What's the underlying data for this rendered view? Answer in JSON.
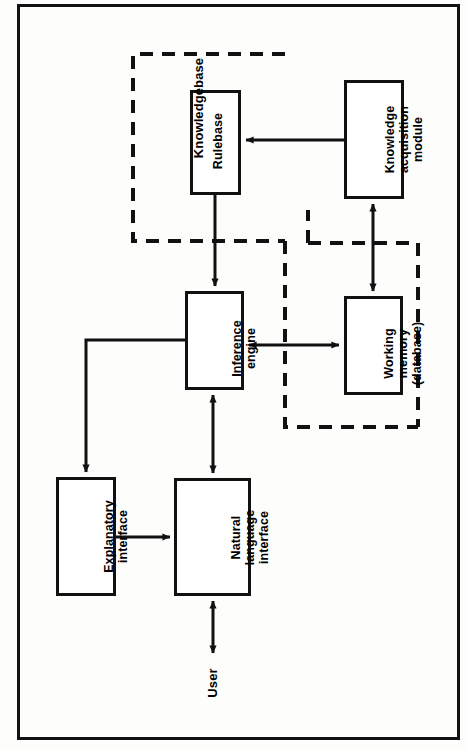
{
  "figure": {
    "orientation": "rotated-90-ccw",
    "frame": {
      "label": "figure-outer-border"
    },
    "colors": {
      "stroke": "#111111",
      "background": "#fdfdfc",
      "box_fill": "#ffffff"
    }
  },
  "nodes": [
    {
      "id": "rulebase",
      "label": "Rulebase",
      "shape": "rectangle",
      "border": "solid"
    },
    {
      "id": "knowledge-acquisition",
      "label": "Knowledge\nacquisition\nmodule",
      "shape": "rectangle",
      "border": "solid"
    },
    {
      "id": "inference-engine",
      "label": "Inference\nengine",
      "shape": "rectangle",
      "border": "solid"
    },
    {
      "id": "working-memory",
      "label": "Working\nmemory\n(database)",
      "shape": "rectangle",
      "border": "solid"
    },
    {
      "id": "explanatory-interface",
      "label": "Explanatory\ninterface",
      "shape": "rectangle",
      "border": "solid"
    },
    {
      "id": "natural-language-interface",
      "label": "Natural\nlanguage\ninterface",
      "shape": "rectangle",
      "border": "solid"
    }
  ],
  "groups": [
    {
      "id": "knowledgebase",
      "label": "Knowledgebase",
      "border": "dashed",
      "contains": [
        "rulebase"
      ]
    },
    {
      "id": "working-memory-group",
      "label": "",
      "border": "dashed",
      "contains": [
        "working-memory"
      ]
    }
  ],
  "free_labels": [
    {
      "id": "user",
      "label": "User"
    }
  ],
  "edges": [
    {
      "id": "ka-to-rulebase",
      "from": "knowledge-acquisition",
      "to": "rulebase",
      "arrow": "single"
    },
    {
      "id": "rulebase-to-engine",
      "from": "rulebase",
      "to": "inference-engine",
      "arrow": "single"
    },
    {
      "id": "ka-to-working-memory",
      "from": "knowledge-acquisition",
      "to": "working-memory",
      "arrow": "double"
    },
    {
      "id": "engine-working-memory",
      "from": "inference-engine",
      "to": "working-memory",
      "arrow": "double"
    },
    {
      "id": "engine-to-explanatory",
      "from": "inference-engine",
      "to": "explanatory-interface",
      "arrow": "single"
    },
    {
      "id": "explanatory-to-nli",
      "from": "explanatory-interface",
      "to": "natural-language-interface",
      "arrow": "single"
    },
    {
      "id": "engine-to-nli",
      "from": "inference-engine",
      "to": "natural-language-interface",
      "arrow": "double"
    },
    {
      "id": "nli-to-user",
      "from": "natural-language-interface",
      "to": "user",
      "arrow": "double"
    }
  ]
}
